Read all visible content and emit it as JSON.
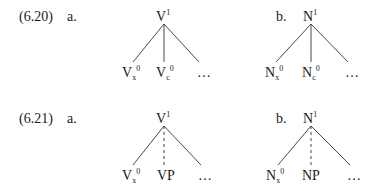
{
  "examples": [
    {
      "number": "(6.20)",
      "a": {
        "label": "a.",
        "root": {
          "base": "V",
          "sup": "1"
        },
        "leaves": [
          {
            "base": "V",
            "sub": "x",
            "sup": "0"
          },
          {
            "base": "V",
            "sub": "c",
            "sup": "0"
          },
          {
            "base": "…"
          }
        ],
        "middle_edge": "solid"
      },
      "b": {
        "label": "b.",
        "root": {
          "base": "N",
          "sup": "1"
        },
        "leaves": [
          {
            "base": "N",
            "sub": "x",
            "sup": "0"
          },
          {
            "base": "N",
            "sub": "c",
            "sup": "0"
          },
          {
            "base": "…"
          }
        ],
        "middle_edge": "solid"
      }
    },
    {
      "number": "(6.21)",
      "a": {
        "label": "a.",
        "root": {
          "base": "V",
          "sup": "1"
        },
        "leaves": [
          {
            "base": "V",
            "sub": "x",
            "sup": "0"
          },
          {
            "base": "VP"
          },
          {
            "base": "…"
          }
        ],
        "middle_edge": "dashed"
      },
      "b": {
        "label": "b.",
        "root": {
          "base": "N",
          "sup": "1"
        },
        "leaves": [
          {
            "base": "N",
            "sub": "x",
            "sup": "0"
          },
          {
            "base": "NP"
          },
          {
            "base": "…"
          }
        ],
        "middle_edge": "dashed"
      }
    }
  ]
}
